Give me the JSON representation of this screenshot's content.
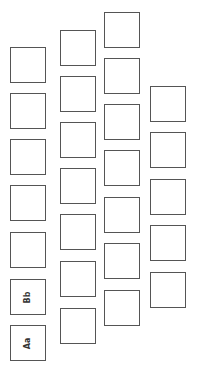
{
  "diagram": {
    "columns": [
      {
        "x": 10,
        "tops": [
          47,
          93,
          139,
          185,
          232,
          279,
          325
        ],
        "labels": [
          "",
          "",
          "",
          "",
          "",
          "Bb",
          "Aa"
        ]
      },
      {
        "x": 60,
        "tops": [
          30,
          76,
          122,
          168,
          214,
          261,
          308
        ],
        "labels": [
          "",
          "",
          "",
          "",
          "",
          "",
          ""
        ]
      },
      {
        "x": 104,
        "tops": [
          12,
          58,
          104,
          150,
          197,
          243,
          290
        ],
        "labels": [
          "",
          "",
          "",
          "",
          "",
          "",
          ""
        ]
      },
      {
        "x": 150,
        "tops": [
          86,
          132,
          179,
          225,
          272
        ],
        "labels": [
          "",
          "",
          "",
          "",
          ""
        ]
      }
    ],
    "box_size": 36,
    "border_color": "#555555"
  }
}
